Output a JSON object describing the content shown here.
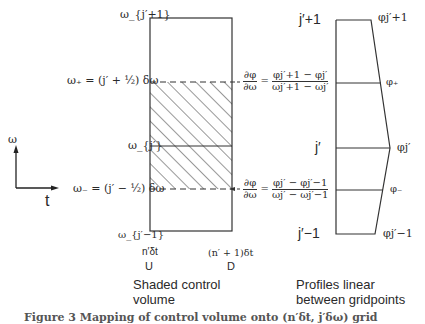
{
  "axes": {
    "vertical_label": "ω",
    "horizontal_label": "t"
  },
  "control_volume_panel": {
    "row_labels": {
      "top": "ω_{j′+1}",
      "plus": "ω₊ = (j′ + ½) δω",
      "mid": "ω_{j′}",
      "minus": "ω₋ = (j′ − ½) δω",
      "bottom": "ω_{j′−1}"
    },
    "column_labels": {
      "left_time": "n′δt",
      "left_letter": "U",
      "right_time": "(n′ + 1)δt",
      "right_letter": "D"
    },
    "caption_line1": "Shaded control",
    "caption_line2": "volume",
    "upper_gradient": {
      "lhs_num": "∂φ",
      "lhs_den": "∂ω",
      "eq": "=",
      "rhs_num": "φj′+1 − φj′",
      "rhs_den": "ωj′+1 − ωj′"
    },
    "lower_gradient": {
      "lhs_num": "∂φ",
      "lhs_den": "∂ω",
      "eq": "=",
      "rhs_num": "φj′ − φj′−1",
      "rhs_den": "ωj′ − ωj′−1"
    }
  },
  "profile_panel": {
    "left_labels": {
      "top": "j′+1",
      "mid": "j′",
      "bottom": "j′−1"
    },
    "right_labels": {
      "top": "φj′+1",
      "plus": "φ₊",
      "mid": "φj′",
      "minus": "φ₋",
      "bottom": "φj′−1"
    },
    "caption_line1": "Profiles linear",
    "caption_line2": "between gridpoints"
  },
  "figure_caption": "Figure 3  Mapping of control volume onto (n′δt, j′δω) grid"
}
